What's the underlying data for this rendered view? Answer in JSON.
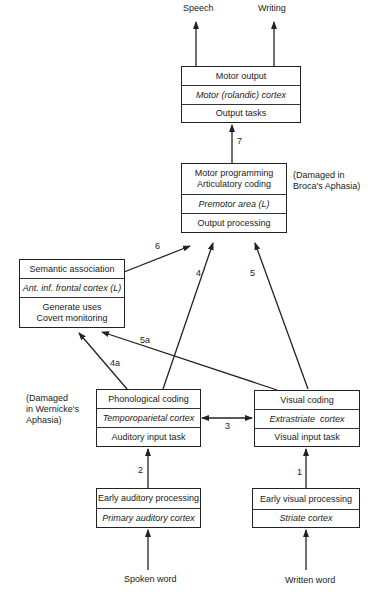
{
  "outputs": {
    "speech": "Speech",
    "writing": "Writing"
  },
  "inputs": {
    "spoken": "Spoken word",
    "written": "Written word"
  },
  "boxes": {
    "motor_output": {
      "rows": [
        "Motor output",
        "Motor (rolandic) cortex",
        "Output tasks"
      ]
    },
    "motor_programming": {
      "rows": [
        "Motor programming\nArticulatory coding",
        "Premotor area (L)",
        "Output processing"
      ],
      "note": "(Damaged in\nBroca's Aphasia)"
    },
    "semantic": {
      "rows": [
        "Semantic association",
        "Ant. inf. frontal cortex (L)",
        "Generate uses\nCovert monitoring"
      ]
    },
    "phonological": {
      "rows": [
        "Phonological coding",
        "Temporoparietal cortex",
        "Auditory input task"
      ],
      "note": "(Damaged\nin Wernicke's\nAphasia)"
    },
    "visual": {
      "rows": [
        "Visual coding",
        "Extrastriate  cortex",
        "Visual input task"
      ]
    },
    "early_auditory": {
      "rows": [
        "Early auditory processing",
        "Primary auditory cortex"
      ]
    },
    "early_visual": {
      "rows": [
        "Early visual processing",
        "Striate cortex"
      ]
    }
  },
  "pathways": {
    "p1": "1",
    "p2": "2",
    "p3": "3",
    "p4": "4",
    "p4a": "4a",
    "p5": "5",
    "p5a": "5a",
    "p6": "6",
    "p7": "7"
  }
}
